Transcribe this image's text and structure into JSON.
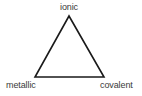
{
  "diagram": {
    "shape": "triangle",
    "stroke_color": "#1a1a1a",
    "label_color": "#3a3a3a",
    "vertices": {
      "top": {
        "label": "ionic"
      },
      "bottom_left": {
        "label": "metallic"
      },
      "bottom_right": {
        "label": "covalent"
      }
    }
  }
}
